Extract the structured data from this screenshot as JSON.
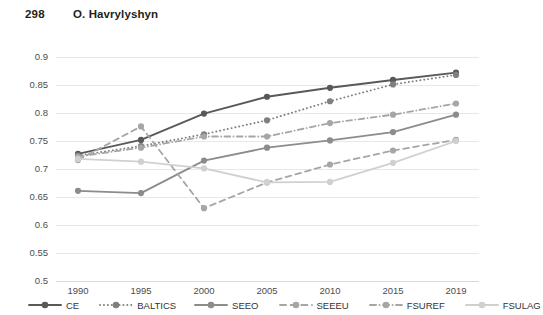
{
  "header": {
    "page_number": "298",
    "author": "O. Havrylyshyn"
  },
  "chart_data": {
    "type": "line",
    "title": "",
    "subtitle": "",
    "xlabel": "",
    "ylabel": "",
    "grid": true,
    "legend_position": "bottom",
    "categories": [
      "1990",
      "1995",
      "2000",
      "2005",
      "2010",
      "2015",
      "2019"
    ],
    "x": [
      1990,
      1995,
      2000,
      2005,
      2010,
      2015,
      2019
    ],
    "ylim": [
      0.5,
      0.9
    ],
    "ytick_labels": [
      "0.9",
      "0.85",
      "0.8",
      "0.75",
      "0.7",
      "0.65",
      "0.6",
      "0.55",
      "0.5"
    ],
    "yticks": [
      0.9,
      0.85,
      0.8,
      0.75,
      0.7,
      0.65,
      0.6,
      0.55,
      0.5
    ],
    "series": [
      {
        "name": "CE",
        "color": "#595959",
        "style": "solid",
        "values": [
          0.727,
          0.752,
          0.799,
          0.829,
          0.845,
          0.859,
          0.872
        ]
      },
      {
        "name": "BALTICS",
        "color": "#7f7f7f",
        "style": "dotted",
        "values": [
          0.724,
          0.741,
          0.762,
          0.787,
          0.821,
          0.851,
          0.868
        ]
      },
      {
        "name": "SEEO",
        "color": "#8c8c8c",
        "style": "solid",
        "values": [
          0.661,
          0.657,
          0.715,
          0.738,
          0.751,
          0.766,
          0.797
        ]
      },
      {
        "name": "SEEEU",
        "color": "#a6a6a6",
        "style": "dashed",
        "values": [
          0.716,
          0.776,
          0.63,
          0.676,
          0.708,
          0.733,
          0.752
        ]
      },
      {
        "name": "FSUREF",
        "color": "#a6a6a6",
        "style": "dashdot",
        "values": [
          0.722,
          0.738,
          0.758,
          0.758,
          0.782,
          0.797,
          0.817
        ]
      },
      {
        "name": "FSULAG",
        "color": "#d0d0d0",
        "style": "solid",
        "values": [
          0.718,
          0.713,
          0.701,
          0.676,
          0.677,
          0.711,
          0.75
        ]
      }
    ]
  },
  "legend": {
    "items": [
      {
        "label": "CE",
        "color": "#595959",
        "style": "solid"
      },
      {
        "label": "BALTICS",
        "color": "#7f7f7f",
        "style": "dotted"
      },
      {
        "label": "SEEO",
        "color": "#8c8c8c",
        "style": "solid"
      },
      {
        "label": "SEEEU",
        "color": "#a6a6a6",
        "style": "dashed"
      },
      {
        "label": "FSUREF",
        "color": "#a6a6a6",
        "style": "dashdot"
      },
      {
        "label": "FSULAG",
        "color": "#d0d0d0",
        "style": "solid"
      }
    ]
  }
}
